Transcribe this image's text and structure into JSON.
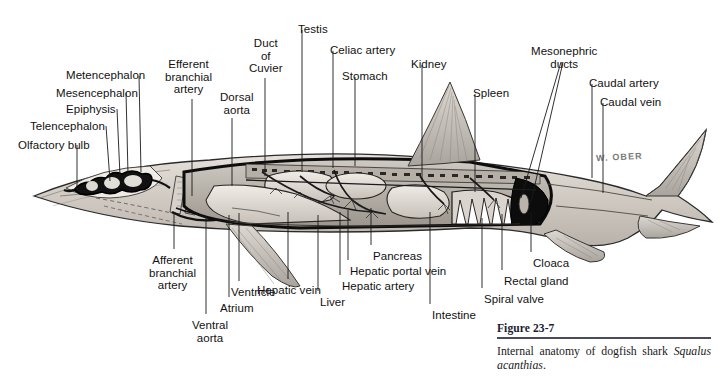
{
  "figure": {
    "caption_title": "Figure 23-7",
    "caption_text_before": "Internal anatomy of dogfish shark ",
    "caption_species": "Squalus acanthias",
    "caption_text_after": ".",
    "artist_signature": "W. OBER"
  },
  "colors": {
    "ink": "#111111",
    "leader_line": "#1a1a1a",
    "body_fill": "#dedad4",
    "body_shade": "#b3aea7",
    "cavity_dark": "#111111",
    "organ_light": "#e6e2dc",
    "organ_mid": "#c2bdb6",
    "caption_rule": "#4a4a58"
  },
  "labels": [
    {
      "id": "olfactory-bulb",
      "text": "Olfactory bulb",
      "x": 18,
      "y": 139,
      "align": "left",
      "anchor": "start"
    },
    {
      "id": "telencephalon",
      "text": "Telencephalon",
      "x": 30,
      "y": 120,
      "align": "left",
      "anchor": "start"
    },
    {
      "id": "epiphysis",
      "text": "Epiphysis",
      "x": 66,
      "y": 103,
      "align": "left",
      "anchor": "start"
    },
    {
      "id": "mesencephalon",
      "text": "Mesencephalon",
      "x": 56,
      "y": 87,
      "align": "left",
      "anchor": "start"
    },
    {
      "id": "metencephalon",
      "text": "Metencephalon",
      "x": 66,
      "y": 69,
      "align": "left",
      "anchor": "start"
    },
    {
      "id": "efferent-branchial-artery",
      "text": "Efferent\nbranchial\nartery",
      "x": 165,
      "y": 58,
      "align": "center",
      "anchor": "start"
    },
    {
      "id": "dorsal-aorta",
      "text": "Dorsal\naorta",
      "x": 220,
      "y": 91,
      "align": "center",
      "anchor": "start"
    },
    {
      "id": "duct-of-cuvier",
      "text": "Duct\nof\nCuvier",
      "x": 249,
      "y": 37,
      "align": "center",
      "anchor": "start"
    },
    {
      "id": "testis",
      "text": "Testis",
      "x": 298,
      "y": 23,
      "align": "center",
      "anchor": "start"
    },
    {
      "id": "celiac-artery",
      "text": "Celiac artery",
      "x": 330,
      "y": 44,
      "align": "left",
      "anchor": "start"
    },
    {
      "id": "stomach",
      "text": "Stomach",
      "x": 342,
      "y": 70,
      "align": "left",
      "anchor": "start"
    },
    {
      "id": "kidney",
      "text": "Kidney",
      "x": 411,
      "y": 58,
      "align": "left",
      "anchor": "start"
    },
    {
      "id": "spleen",
      "text": "Spleen",
      "x": 473,
      "y": 87,
      "align": "left",
      "anchor": "start"
    },
    {
      "id": "mesonephric-ducts",
      "text": "Mesonephric\nducts",
      "x": 531,
      "y": 45,
      "align": "center",
      "anchor": "start"
    },
    {
      "id": "caudal-artery",
      "text": "Caudal artery",
      "x": 589,
      "y": 77,
      "align": "left",
      "anchor": "start"
    },
    {
      "id": "caudal-vein",
      "text": "Caudal vein",
      "x": 600,
      "y": 96,
      "align": "left",
      "anchor": "start"
    },
    {
      "id": "afferent-branchial-artery",
      "text": "Afferent\nbranchial\nartery",
      "x": 149,
      "y": 254,
      "align": "center",
      "anchor": "start"
    },
    {
      "id": "ventral-aorta",
      "text": "Ventral\naorta",
      "x": 192,
      "y": 319,
      "align": "center",
      "anchor": "start"
    },
    {
      "id": "atrium",
      "text": "Atrium",
      "x": 220,
      "y": 302,
      "align": "left",
      "anchor": "start"
    },
    {
      "id": "ventricle",
      "text": "Ventricle",
      "x": 231,
      "y": 286,
      "align": "left",
      "anchor": "start"
    },
    {
      "id": "hepatic-vein",
      "text": "Hepatic vein",
      "x": 257,
      "y": 284,
      "align": "left",
      "anchor": "start"
    },
    {
      "id": "liver",
      "text": "Liver",
      "x": 320,
      "y": 296,
      "align": "left",
      "anchor": "start"
    },
    {
      "id": "hepatic-artery",
      "text": "Hepatic artery",
      "x": 342,
      "y": 280,
      "align": "left",
      "anchor": "start"
    },
    {
      "id": "hepatic-portal-vein",
      "text": "Hepatic portal vein",
      "x": 350,
      "y": 265,
      "align": "left",
      "anchor": "start"
    },
    {
      "id": "pancreas",
      "text": "Pancreas",
      "x": 373,
      "y": 250,
      "align": "left",
      "anchor": "start"
    },
    {
      "id": "intestine",
      "text": "Intestine",
      "x": 432,
      "y": 309,
      "align": "left",
      "anchor": "start"
    },
    {
      "id": "spiral-valve",
      "text": "Spiral valve",
      "x": 484,
      "y": 293,
      "align": "left",
      "anchor": "start"
    },
    {
      "id": "rectal-gland",
      "text": "Rectal gland",
      "x": 504,
      "y": 275,
      "align": "left",
      "anchor": "start"
    },
    {
      "id": "cloaca",
      "text": "Cloaca",
      "x": 533,
      "y": 257,
      "align": "left",
      "anchor": "start"
    }
  ],
  "leader_lines": [
    {
      "id": "olfactory-bulb",
      "x1": 77,
      "y1": 145,
      "x2": 77,
      "y2": 190
    },
    {
      "id": "telencephalon",
      "x1": 106,
      "y1": 126,
      "x2": 110,
      "y2": 181
    },
    {
      "id": "epiphysis",
      "x1": 117,
      "y1": 109,
      "x2": 120,
      "y2": 176
    },
    {
      "id": "mesencephalon",
      "x1": 126,
      "y1": 93,
      "x2": 128,
      "y2": 174
    },
    {
      "id": "metencephalon",
      "x1": 139,
      "y1": 76,
      "x2": 141,
      "y2": 172
    },
    {
      "id": "efferent-branchial-artery",
      "x1": 192,
      "y1": 99,
      "x2": 192,
      "y2": 196
    },
    {
      "id": "dorsal-aorta",
      "x1": 232,
      "y1": 118,
      "x2": 232,
      "y2": 186
    },
    {
      "id": "duct-of-cuvier",
      "x1": 265,
      "y1": 78,
      "x2": 265,
      "y2": 176
    },
    {
      "id": "testis",
      "x1": 302,
      "y1": 30,
      "x2": 302,
      "y2": 172
    },
    {
      "id": "celiac-artery",
      "x1": 333,
      "y1": 51,
      "x2": 333,
      "y2": 168
    },
    {
      "id": "stomach",
      "x1": 355,
      "y1": 77,
      "x2": 355,
      "y2": 166
    },
    {
      "id": "kidney",
      "x1": 422,
      "y1": 65,
      "x2": 422,
      "y2": 182
    },
    {
      "id": "spleen",
      "x1": 475,
      "y1": 94,
      "x2": 475,
      "y2": 192
    },
    {
      "id": "mesonephric-ducts-a",
      "x1": 561,
      "y1": 62,
      "x2": 521,
      "y2": 198
    },
    {
      "id": "mesonephric-ducts-b",
      "x1": 563,
      "y1": 62,
      "x2": 531,
      "y2": 202
    },
    {
      "id": "caudal-artery",
      "x1": 592,
      "y1": 84,
      "x2": 592,
      "y2": 178
    },
    {
      "id": "caudal-vein",
      "x1": 603,
      "y1": 103,
      "x2": 603,
      "y2": 193
    },
    {
      "id": "afferent-branchial-artery",
      "x1": 174,
      "y1": 249,
      "x2": 174,
      "y2": 212
    },
    {
      "id": "ventral-aorta",
      "x1": 206,
      "y1": 314,
      "x2": 206,
      "y2": 216
    },
    {
      "id": "atrium",
      "x1": 229,
      "y1": 297,
      "x2": 229,
      "y2": 215
    },
    {
      "id": "ventricle",
      "x1": 239,
      "y1": 281,
      "x2": 239,
      "y2": 213
    },
    {
      "id": "hepatic-vein",
      "x1": 288,
      "y1": 279,
      "x2": 288,
      "y2": 212
    },
    {
      "id": "liver",
      "x1": 318,
      "y1": 291,
      "x2": 318,
      "y2": 215
    },
    {
      "id": "hepatic-artery",
      "x1": 340,
      "y1": 275,
      "x2": 340,
      "y2": 212
    },
    {
      "id": "hepatic-portal-vein",
      "x1": 348,
      "y1": 260,
      "x2": 348,
      "y2": 210
    },
    {
      "id": "pancreas",
      "x1": 371,
      "y1": 245,
      "x2": 371,
      "y2": 208
    },
    {
      "id": "intestine",
      "x1": 430,
      "y1": 304,
      "x2": 430,
      "y2": 212
    },
    {
      "id": "spiral-valve",
      "x1": 482,
      "y1": 288,
      "x2": 482,
      "y2": 218
    },
    {
      "id": "rectal-gland",
      "x1": 502,
      "y1": 270,
      "x2": 502,
      "y2": 214
    },
    {
      "id": "cloaca",
      "x1": 531,
      "y1": 252,
      "x2": 531,
      "y2": 212
    }
  ]
}
